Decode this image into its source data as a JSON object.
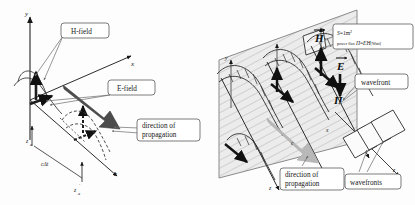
{
  "figure": {
    "panels": [
      {
        "id": "left",
        "name": "instantaneous-field-vectors",
        "axes": {
          "y": "y",
          "x": "x",
          "z": "z"
        },
        "labels": {
          "h_field": "H-field",
          "e_field": "E-field",
          "direction_line1": "direction of",
          "direction_line2": "propagation"
        },
        "annotations": {
          "distance": "cΔt",
          "z_start": "z",
          "z_start_sub": "a",
          "z_end": "z",
          "z_end_sub": "a"
        }
      },
      {
        "id": "right",
        "name": "wavefront-plane-power-flux",
        "axes": {
          "y": "y",
          "x": "x",
          "z": "z",
          "z_inset": "z"
        },
        "labels": {
          "h_vector": "H",
          "e_vector": "E",
          "poynting_vector": "Π",
          "speed": "c",
          "wavefront": "wavefront",
          "wavefronts": "wavefronts",
          "direction_line1": "direction of",
          "direction_line2": "propagation"
        },
        "formula": {
          "area_symbol": "S",
          "area_value": "=1m",
          "area_exponent": "2",
          "flux_prefix": "power flux ",
          "flux_symbol": "Π",
          "flux_equals": "=",
          "flux_expr": "EH",
          "flux_unit": "[Watt]"
        }
      }
    ],
    "colors": {
      "stroke": "#161616",
      "dark_arrow": "#4c4c4c",
      "light_arrow": "#b4b4b4",
      "plane_fill": "#e9e9e9",
      "hatch": "#9a9a9a",
      "callout_border": "#5a5a5a",
      "callout_fill": "#ffffff",
      "background": "#fdfdfd"
    }
  }
}
